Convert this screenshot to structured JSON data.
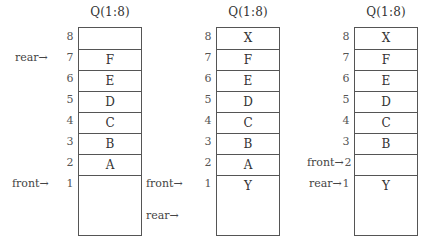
{
  "diagrams": [
    {
      "title": "Q(1:8)",
      "indices": [
        "8",
        "7",
        "6",
        "5",
        "4",
        "3",
        "2",
        "1"
      ],
      "cells": [
        "",
        "F",
        "E",
        "D",
        "C",
        "B",
        "A",
        ""
      ],
      "pointers": {
        "rear": {
          "label": "rear→",
          "at": "7"
        },
        "front": {
          "label": "front→",
          "at": "1"
        }
      }
    },
    {
      "title": "Q(1:8)",
      "indices": [
        "8",
        "7",
        "6",
        "5",
        "4",
        "3",
        "2",
        "1"
      ],
      "cells": [
        "X",
        "F",
        "E",
        "D",
        "C",
        "B",
        "A",
        "Y"
      ],
      "pointers": {
        "front": {
          "label": "front→",
          "at": "1"
        },
        "rear": {
          "label": "rear→",
          "at": "below 1"
        }
      }
    },
    {
      "title": "Q(1:8)",
      "indices": [
        "8",
        "7",
        "6",
        "5",
        "4",
        "3",
        "2",
        "1"
      ],
      "cells": [
        "X",
        "F",
        "E",
        "D",
        "C",
        "B",
        "",
        "Y"
      ],
      "pointers": {
        "front": {
          "label": "front→",
          "at": "2"
        },
        "rear": {
          "label": "rear→",
          "at": "1"
        }
      }
    }
  ]
}
